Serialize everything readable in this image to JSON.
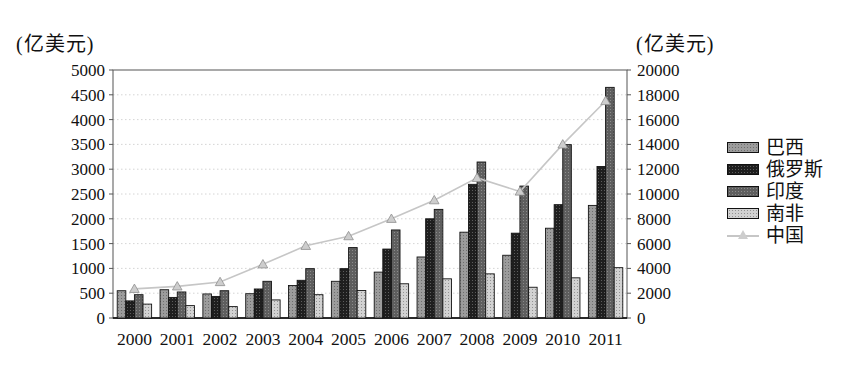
{
  "chart_data": {
    "type": "bar+line combo, grouped bars on left axis, line with triangle markers on right axis",
    "categories": [
      "2000",
      "2001",
      "2002",
      "2003",
      "2004",
      "2005",
      "2006",
      "2007",
      "2008",
      "2009",
      "2010",
      "2011"
    ],
    "series": [
      {
        "name": "巴西",
        "type": "bar",
        "axis": "left",
        "color": "#9c9c9c",
        "values": [
          550,
          570,
          485,
          490,
          655,
          740,
          925,
          1230,
          1730,
          1265,
          1810,
          2270
        ]
      },
      {
        "name": "俄罗斯",
        "type": "bar",
        "axis": "left",
        "color": "#1f1f1f",
        "values": [
          345,
          415,
          435,
          585,
          760,
          995,
          1390,
          2000,
          2695,
          1710,
          2285,
          3055
        ]
      },
      {
        "name": "印度",
        "type": "bar",
        "axis": "left",
        "color": "#5e5e5e",
        "values": [
          470,
          525,
          550,
          740,
          995,
          1420,
          1775,
          2190,
          3145,
          2660,
          3495,
          4650
        ]
      },
      {
        "name": "南非",
        "type": "bar",
        "axis": "left",
        "color": "#d2d2d2",
        "values": [
          280,
          250,
          230,
          365,
          470,
          555,
          690,
          790,
          890,
          620,
          810,
          1015
        ]
      },
      {
        "name": "中国",
        "type": "line",
        "axis": "right",
        "color": "#c6c6c6",
        "marker": "triangle",
        "marker_fill": "#cdcdcd",
        "marker_edge": "#8f8f8f",
        "values": [
          2350,
          2550,
          2900,
          4330,
          5820,
          6600,
          8000,
          9500,
          11300,
          10200,
          14000,
          17500
        ]
      }
    ],
    "left_axis": {
      "label": "(亿美元)",
      "min": 0,
      "max": 5000,
      "step": 500,
      "ticks": [
        "0",
        "500",
        "1000",
        "1500",
        "2000",
        "2500",
        "3000",
        "3500",
        "4000",
        "4500",
        "5000"
      ]
    },
    "right_axis": {
      "label": "(亿美元)",
      "min": 0,
      "max": 20000,
      "step": 2000,
      "ticks": [
        "0",
        "2000",
        "4000",
        "6000",
        "8000",
        "10000",
        "12000",
        "14000",
        "16000",
        "18000",
        "20000"
      ]
    },
    "grid": {
      "horizontal": true,
      "dotted": true,
      "color": "#c9c9c9",
      "every_left_units": 500
    },
    "legend_position": "right",
    "title": ""
  },
  "legend": {
    "items": [
      "巴西",
      "俄罗斯",
      "印度",
      "南非",
      "中国"
    ]
  },
  "colors": {
    "frame": "#555555",
    "axis_line": "#000000",
    "tick_text": "#111111",
    "bar_outline": "#141414"
  }
}
